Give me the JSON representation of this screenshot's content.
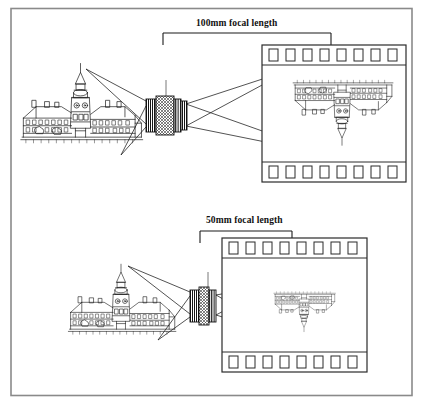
{
  "figure": {
    "type": "diagram",
    "border_color": "#7a7a7a",
    "ink_color": "#1a1a1a",
    "background": "#ffffff"
  },
  "panels": [
    {
      "id": "panel-100mm",
      "label": "100mm focal length",
      "focal_length_mm": 100,
      "subject": "ornate-building-with-clock-tower",
      "lens": "telephoto-lens-barrel",
      "film": {
        "name": "35mm-film-strip",
        "sprocket_holes_top": 8,
        "sprocket_holes_bottom": 8,
        "image_orientation": "inverted",
        "image_size": "large"
      },
      "rays": 4
    },
    {
      "id": "panel-50mm",
      "label": "50mm focal length",
      "focal_length_mm": 50,
      "subject": "ornate-building-with-clock-tower",
      "lens": "normal-lens-barrel",
      "film": {
        "name": "35mm-film-strip",
        "sprocket_holes_top": 8,
        "sprocket_holes_bottom": 8,
        "image_orientation": "inverted",
        "image_size": "small"
      },
      "rays": 4
    }
  ],
  "labels": {
    "focal_100": "100mm focal length",
    "focal_50": "50mm focal length"
  }
}
